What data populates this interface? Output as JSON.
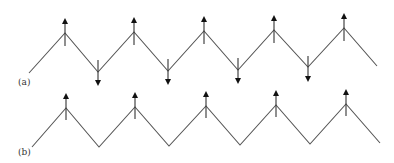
{
  "diagram": {
    "colors": {
      "line": "#555555",
      "arrow": "#111111",
      "background": "#ffffff"
    },
    "panels": [
      {
        "label": "(a)",
        "label_pos": [
          18,
          85
        ],
        "vertices": [
          [
            29,
            73
          ],
          [
            65,
            33
          ],
          [
            98,
            72
          ],
          [
            134,
            32
          ],
          [
            168,
            71
          ],
          [
            204,
            31
          ],
          [
            238,
            70
          ],
          [
            274,
            30
          ],
          [
            308,
            67
          ],
          [
            344,
            28
          ],
          [
            377,
            66
          ]
        ],
        "arrows": [
          {
            "x": 65,
            "y_tail": 46,
            "y_tip": 18,
            "dir": "up"
          },
          {
            "x": 98,
            "y_tail": 60,
            "y_tip": 86,
            "dir": "down"
          },
          {
            "x": 134,
            "y_tail": 45,
            "y_tip": 17,
            "dir": "up"
          },
          {
            "x": 168,
            "y_tail": 59,
            "y_tip": 85,
            "dir": "down"
          },
          {
            "x": 204,
            "y_tail": 44,
            "y_tip": 16,
            "dir": "up"
          },
          {
            "x": 238,
            "y_tail": 58,
            "y_tip": 84,
            "dir": "down"
          },
          {
            "x": 274,
            "y_tail": 43,
            "y_tip": 15,
            "dir": "up"
          },
          {
            "x": 308,
            "y_tail": 56,
            "y_tip": 82,
            "dir": "down"
          },
          {
            "x": 344,
            "y_tail": 41,
            "y_tip": 13,
            "dir": "up"
          }
        ]
      },
      {
        "label": "(b)",
        "label_pos": [
          18,
          155
        ],
        "vertices": [
          [
            32,
            147
          ],
          [
            66,
            108
          ],
          [
            99,
            147
          ],
          [
            135,
            107
          ],
          [
            169,
            146
          ],
          [
            206,
            106
          ],
          [
            240,
            145
          ],
          [
            276,
            105
          ],
          [
            310,
            144
          ],
          [
            346,
            104
          ],
          [
            380,
            143
          ]
        ],
        "arrows": [
          {
            "x": 66,
            "y_tail": 120,
            "y_tip": 93,
            "dir": "up"
          },
          {
            "x": 135,
            "y_tail": 119,
            "y_tip": 92,
            "dir": "up"
          },
          {
            "x": 206,
            "y_tail": 118,
            "y_tip": 91,
            "dir": "up"
          },
          {
            "x": 276,
            "y_tail": 117,
            "y_tip": 90,
            "dir": "up"
          },
          {
            "x": 346,
            "y_tail": 116,
            "y_tip": 89,
            "dir": "up"
          }
        ]
      }
    ]
  }
}
